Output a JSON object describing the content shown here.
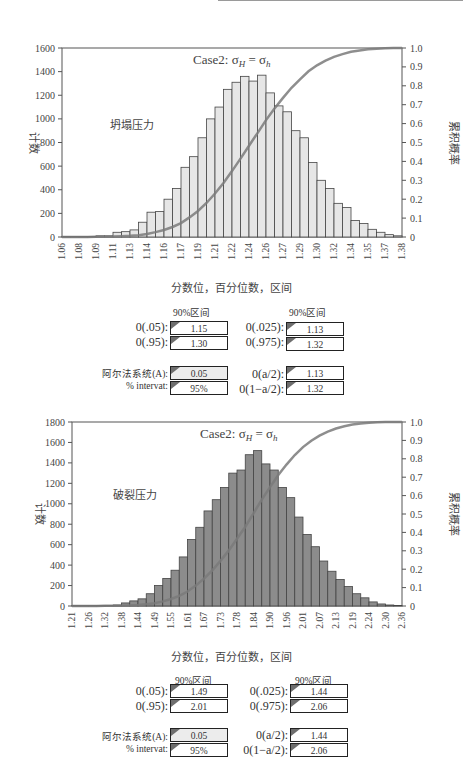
{
  "charts": [
    {
      "title": "Case2: σH = σh",
      "annotation": "坍塌压力",
      "ylabel_left": "计数",
      "ylabel_right": "累积概率",
      "xlabel": "分数位，百分位数，区间",
      "left_ticks": [
        "0",
        "200",
        "400",
        "600",
        "800",
        "1000",
        "1200",
        "1400",
        "1600"
      ],
      "right_ticks": [
        "0",
        "0.1",
        "0.2",
        "0.3",
        "0.4",
        "0.5",
        "0.6",
        "0.7",
        "0.8",
        "0.9",
        "1.0"
      ],
      "x_ticks": [
        "1.06",
        "1.08",
        "1.09",
        "1.11",
        "1.13",
        "1.14",
        "1.16",
        "1.17",
        "1.19",
        "1.21",
        "1.22",
        "1.24",
        "1.26",
        "1.27",
        "1.29",
        "1.30",
        "1.32",
        "1.34",
        "1.35",
        "1.37",
        "1.38"
      ],
      "stats": {
        "header_left": "90%区间",
        "header_right": "90%区间",
        "q05_label": "0(.05):",
        "q05": "1.15",
        "q95_label": "0(.95):",
        "q95": "1.30",
        "q025_label": "0(.025):",
        "q025": "1.13",
        "q975_label": "0(.975):",
        "q975": "1.32",
        "alpha_label": "阿尔法系统(A):",
        "alpha": "0.05",
        "interval_label": "% intervat:",
        "interval": "95%",
        "qa2_label": "0(a/2):",
        "qa2": "1.13",
        "q1a2_label": "0(1−a/2):",
        "q1a2": "1.32"
      }
    },
    {
      "title": "Case2: σH = σh",
      "annotation": "破裂压力",
      "ylabel_left": "计数",
      "ylabel_right": "累积概率",
      "xlabel": "分数位，百分位数，区间",
      "left_ticks": [
        "0",
        "200",
        "400",
        "600",
        "800",
        "1000",
        "1200",
        "1400",
        "1600",
        "1800"
      ],
      "right_ticks": [
        "0",
        "0.1",
        "0.2",
        "0.3",
        "0.4",
        "0.5",
        "0.6",
        "0.7",
        "0.8",
        "0.9",
        "1.0"
      ],
      "x_ticks": [
        "1.21",
        "1.26",
        "1.32",
        "1.38",
        "1.44",
        "1.49",
        "1.55",
        "1.61",
        "1.67",
        "1.73",
        "1.78",
        "1.84",
        "1.90",
        "1.96",
        "2.01",
        "2.07",
        "2.13",
        "2.19",
        "2.24",
        "2.30",
        "2.36"
      ],
      "stats": {
        "header_left": "90%区间",
        "header_right": "90%区间",
        "q05_label": "0(.05):",
        "q05": "1.49",
        "q95_label": "0(.95):",
        "q95": "2.01",
        "q025_label": "0(.025):",
        "q025": "1.44",
        "q975_label": "0(.975):",
        "q975": "2.06",
        "alpha_label": "阿尔法系统(A):",
        "alpha": "0.05",
        "interval_label": "% intervat:",
        "interval": "95%",
        "qa2_label": "0(a/2):",
        "qa2": "1.44",
        "q1a2_label": "0(1−a/2):",
        "q1a2": "2.06"
      }
    }
  ],
  "chart_data": [
    {
      "type": "bar",
      "title": "Case2: σH = σh (坍塌压力)",
      "xlabel": "分数位，百分位数，区间",
      "ylabel": "计数",
      "y2label": "累积概率",
      "ylim": [
        0,
        1600
      ],
      "y2lim": [
        0,
        1.0
      ],
      "bar_color": "#e6e6e6",
      "curve_color": "#7a7a7a",
      "x_range": [
        1.06,
        1.38
      ],
      "bin_count": 40,
      "values": [
        5,
        5,
        5,
        5,
        10,
        10,
        40,
        45,
        60,
        125,
        210,
        215,
        320,
        410,
        590,
        680,
        840,
        1000,
        1100,
        1250,
        1310,
        1360,
        1320,
        1370,
        1220,
        1110,
        1060,
        900,
        840,
        630,
        480,
        410,
        285,
        250,
        140,
        115,
        65,
        40,
        20,
        10
      ],
      "grid": false,
      "series": [
        {
          "name": "计数",
          "type": "bar"
        },
        {
          "name": "累积概率",
          "type": "line",
          "axis": "right"
        }
      ]
    },
    {
      "type": "bar",
      "title": "Case2: σH = σh (破裂压力)",
      "xlabel": "分数位，百分位数，区间",
      "ylabel": "计数",
      "y2label": "累积概率",
      "ylim": [
        0,
        1800
      ],
      "y2lim": [
        0,
        1.0
      ],
      "bar_color": "#8c8c8c",
      "curve_color": "#7a7a7a",
      "x_range": [
        1.21,
        2.36
      ],
      "bin_count": 40,
      "values": [
        5,
        5,
        5,
        5,
        5,
        10,
        30,
        50,
        70,
        120,
        200,
        270,
        350,
        480,
        650,
        770,
        930,
        1040,
        1160,
        1300,
        1330,
        1480,
        1520,
        1390,
        1330,
        1160,
        1060,
        870,
        700,
        580,
        440,
        340,
        260,
        190,
        120,
        80,
        40,
        20,
        10,
        5
      ],
      "grid": false,
      "series": [
        {
          "name": "计数",
          "type": "bar"
        },
        {
          "name": "累积概率",
          "type": "line",
          "axis": "right"
        }
      ]
    }
  ]
}
